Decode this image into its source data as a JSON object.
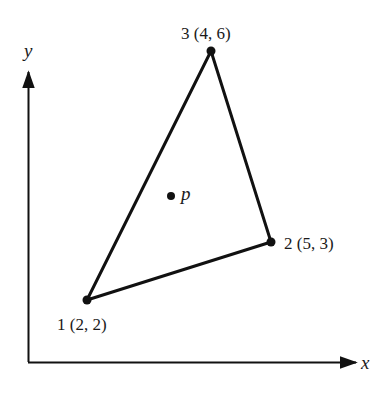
{
  "figure": {
    "axes": {
      "x_label": "x",
      "y_label": "y"
    },
    "triangle": {
      "vertices": [
        {
          "id": "1",
          "label": "1 (2, 2)",
          "coords": [
            2,
            2
          ]
        },
        {
          "id": "2",
          "label": "2 (5, 3)",
          "coords": [
            5,
            3
          ]
        },
        {
          "id": "3",
          "label": "3 (4, 6)",
          "coords": [
            4,
            6
          ]
        }
      ]
    },
    "interior_point": {
      "label": "p"
    },
    "colors": {
      "stroke": "#111111",
      "background": "#ffffff"
    }
  }
}
